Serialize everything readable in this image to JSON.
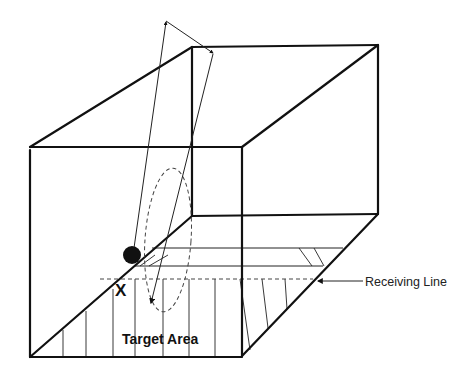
{
  "diagram": {
    "labels": {
      "marker": "X",
      "target_area": "Target Area",
      "receiving_line": "Receiving Line"
    },
    "elements": {
      "ball": "ball",
      "trajectory": "arced trajectory with arrows",
      "dashed_path": "dashed elliptical path"
    },
    "colors": {
      "line": "#111111",
      "background": "#ffffff"
    }
  }
}
